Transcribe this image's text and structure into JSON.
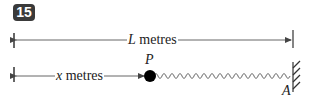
{
  "question_number": "15",
  "top_dimension": {
    "variable": "L",
    "unit": " metres"
  },
  "bottom_dimension": {
    "variable": "x",
    "unit": " metres"
  },
  "point_label": "P",
  "anchor_label": "A",
  "colors": {
    "line": "#444444",
    "badge": "#3a3a3a",
    "mass": "#000000"
  }
}
